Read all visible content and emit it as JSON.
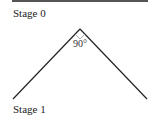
{
  "diagram": {
    "top_label": "Stage 0",
    "bottom_label": "Stage 1",
    "angle_label": "90°",
    "apex": [
      80,
      29
    ],
    "left_end": [
      13,
      99
    ],
    "right_end": [
      147,
      99
    ],
    "line_color": "#222222"
  }
}
